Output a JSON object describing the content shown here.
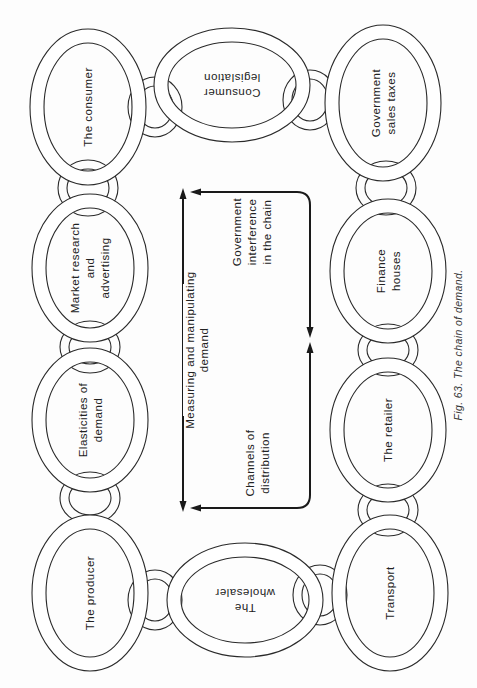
{
  "figure": {
    "caption": "Fig. 63.  The chain of demand.",
    "colors": {
      "line": "#2a2a2a",
      "background": "#fdfdfd",
      "text": "#222222"
    }
  },
  "rings": [
    {
      "id": "consumer",
      "lines": [
        "The consumer"
      ],
      "cx": 88,
      "cy": 107,
      "rx": 58,
      "ry": 78,
      "rot": -90
    },
    {
      "id": "market-research",
      "lines": [
        "Market research",
        "and",
        "advertising"
      ],
      "cx": 90,
      "cy": 268,
      "rx": 58,
      "ry": 74,
      "rot": -90
    },
    {
      "id": "elasticities",
      "lines": [
        "Elasticities of",
        "demand"
      ],
      "cx": 90,
      "cy": 420,
      "rx": 58,
      "ry": 72,
      "rot": -90
    },
    {
      "id": "producer",
      "lines": [
        "The producer"
      ],
      "cx": 90,
      "cy": 593,
      "rx": 58,
      "ry": 78,
      "rot": -90
    },
    {
      "id": "consumer-legislation",
      "lines": [
        "Consumer",
        "legislation"
      ],
      "cx": 232,
      "cy": 85,
      "rx": 78,
      "ry": 57,
      "rot": 180
    },
    {
      "id": "government-sales-taxes",
      "lines": [
        "Government",
        "sales taxes"
      ],
      "cx": 383,
      "cy": 103,
      "rx": 58,
      "ry": 78,
      "rot": -90
    },
    {
      "id": "finance-houses",
      "lines": [
        "Finance",
        "houses"
      ],
      "cx": 388,
      "cy": 271,
      "rx": 58,
      "ry": 72,
      "rot": -90
    },
    {
      "id": "retailer",
      "lines": [
        "The retailer"
      ],
      "cx": 388,
      "cy": 430,
      "rx": 58,
      "ry": 72,
      "rot": -90
    },
    {
      "id": "transport",
      "lines": [
        "Transport"
      ],
      "cx": 390,
      "cy": 593,
      "rx": 58,
      "ry": 78,
      "rot": -90
    },
    {
      "id": "wholesaler",
      "lines": [
        "The",
        "wholesaler"
      ],
      "cx": 245,
      "cy": 600,
      "rx": 78,
      "ry": 57,
      "rot": 180
    }
  ],
  "links": [
    {
      "cx": 88,
      "cy": 188,
      "rx": 30,
      "ry": 28
    },
    {
      "cx": 90,
      "cy": 347,
      "rx": 30,
      "ry": 26
    },
    {
      "cx": 90,
      "cy": 498,
      "rx": 30,
      "ry": 26
    },
    {
      "cx": 155,
      "cy": 107,
      "rx": 27,
      "ry": 30
    },
    {
      "cx": 310,
      "cy": 100,
      "rx": 27,
      "ry": 30
    },
    {
      "cx": 386,
      "cy": 188,
      "rx": 30,
      "ry": 27
    },
    {
      "cx": 388,
      "cy": 350,
      "rx": 30,
      "ry": 26
    },
    {
      "cx": 388,
      "cy": 510,
      "rx": 30,
      "ry": 26
    },
    {
      "cx": 155,
      "cy": 600,
      "rx": 27,
      "ry": 30
    },
    {
      "cx": 320,
      "cy": 595,
      "rx": 27,
      "ry": 30
    }
  ],
  "center": {
    "measuring_label": [
      "Measuring and manipulating",
      "demand"
    ],
    "government_label": [
      "Government",
      "interference",
      "in the chain"
    ],
    "channels_label": [
      "Channels of",
      "distribution"
    ]
  }
}
